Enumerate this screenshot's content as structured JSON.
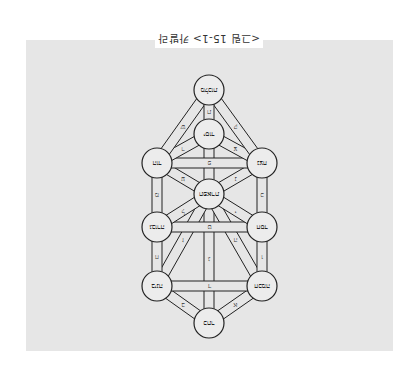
{
  "figure": {
    "caption": "<그림 15-1> 카발라",
    "orientation": "rotated-180",
    "background_color": "#e6e6e6",
    "line_color": "#222222"
  },
  "diagram": {
    "type": "tree-of-life",
    "nodes": [
      {
        "id": "kether",
        "label": "כתר",
        "x": 209,
        "y": 323
      },
      {
        "id": "chokmah",
        "label": "חכמה",
        "x": 262,
        "y": 286
      },
      {
        "id": "binah",
        "label": "בינה",
        "x": 157,
        "y": 286
      },
      {
        "id": "chesed",
        "label": "חסד",
        "x": 262,
        "y": 227
      },
      {
        "id": "geburah",
        "label": "גבורה",
        "x": 157,
        "y": 227
      },
      {
        "id": "tiphareth",
        "label": "תפארת",
        "x": 209,
        "y": 194
      },
      {
        "id": "netzach",
        "label": "נצח",
        "x": 262,
        "y": 163
      },
      {
        "id": "hod",
        "label": "הוד",
        "x": 157,
        "y": 163
      },
      {
        "id": "yesod",
        "label": "יסוד",
        "x": 209,
        "y": 134
      },
      {
        "id": "malkuth",
        "label": "מלכות",
        "x": 209,
        "y": 90
      }
    ],
    "paths": [
      {
        "from": "kether",
        "to": "chokmah",
        "label": "א"
      },
      {
        "from": "kether",
        "to": "binah",
        "label": "ב"
      },
      {
        "from": "kether",
        "to": "tiphareth",
        "label": "ג"
      },
      {
        "from": "chokmah",
        "to": "binah",
        "label": "ד"
      },
      {
        "from": "chokmah",
        "to": "tiphareth",
        "label": "ה"
      },
      {
        "from": "chokmah",
        "to": "chesed",
        "label": "ו"
      },
      {
        "from": "binah",
        "to": "tiphareth",
        "label": "ז"
      },
      {
        "from": "binah",
        "to": "geburah",
        "label": "ח"
      },
      {
        "from": "chesed",
        "to": "geburah",
        "label": "ט"
      },
      {
        "from": "chesed",
        "to": "tiphareth",
        "label": "י"
      },
      {
        "from": "chesed",
        "to": "netzach",
        "label": "כ"
      },
      {
        "from": "geburah",
        "to": "tiphareth",
        "label": "ל"
      },
      {
        "from": "geburah",
        "to": "hod",
        "label": "מ"
      },
      {
        "from": "tiphareth",
        "to": "netzach",
        "label": "נ"
      },
      {
        "from": "tiphareth",
        "to": "yesod",
        "label": "ס"
      },
      {
        "from": "tiphareth",
        "to": "hod",
        "label": "ע"
      },
      {
        "from": "netzach",
        "to": "hod",
        "label": "פ"
      },
      {
        "from": "netzach",
        "to": "yesod",
        "label": "צ"
      },
      {
        "from": "netzach",
        "to": "malkuth",
        "label": "ק"
      },
      {
        "from": "hod",
        "to": "yesod",
        "label": "ר"
      },
      {
        "from": "hod",
        "to": "malkuth",
        "label": "ש"
      },
      {
        "from": "yesod",
        "to": "malkuth",
        "label": "ת"
      }
    ],
    "node_radius": 15,
    "path_width": 10
  }
}
